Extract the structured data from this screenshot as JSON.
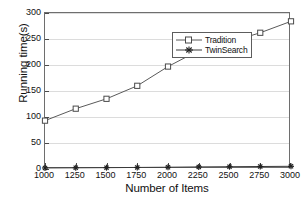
{
  "chart_data": {
    "type": "line",
    "title": "",
    "xlabel": "Number of Items",
    "ylabel": "Running time(s)",
    "x": [
      1000,
      1250,
      1500,
      1750,
      2000,
      2250,
      2500,
      2750,
      3000
    ],
    "xtick_labels": [
      "1000",
      "1250",
      "1500",
      "1750",
      "2000",
      "2250",
      "2500",
      "2750",
      "3000"
    ],
    "ytick_labels": [
      "0",
      "50",
      "100",
      "150",
      "200",
      "250",
      "300"
    ],
    "yticks": [
      0,
      50,
      100,
      150,
      200,
      250,
      300
    ],
    "xlim": [
      1000,
      3000
    ],
    "ylim": [
      0,
      300
    ],
    "grid": true,
    "legend_position": "upper center",
    "series": [
      {
        "name": "Tradition",
        "marker": "open-square",
        "color": "#5a5a5a",
        "values": [
          93,
          116,
          135,
          160,
          197,
          228,
          244,
          262,
          284
        ]
      },
      {
        "name": "TwinSearch",
        "marker": "filled-star",
        "color": "#3a3a3a",
        "values": [
          2,
          2.3,
          2.6,
          3,
          3.4,
          4,
          4.4,
          4.8,
          5.2
        ]
      }
    ]
  },
  "legend": {
    "items": [
      {
        "label": "Tradition",
        "marker": "open-square-marker"
      },
      {
        "label": "TwinSearch",
        "marker": "filled-star-marker"
      }
    ]
  },
  "colors": {
    "axis": "#6e6e6e",
    "grid": "#dcdcdc",
    "series_tradition": "#5a5a5a",
    "series_twinsearch": "#3a3a3a",
    "background": "#ffffff",
    "text": "#111111"
  }
}
